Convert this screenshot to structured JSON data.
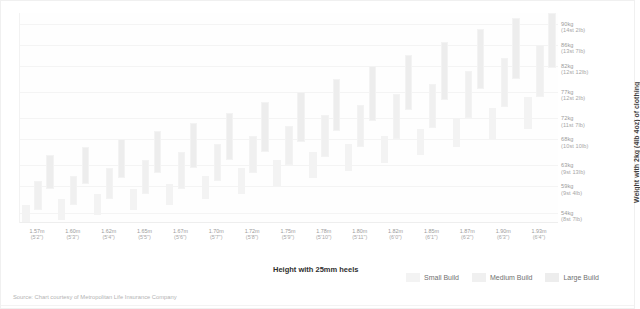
{
  "chart_data": {
    "type": "bar",
    "title": "",
    "subtitle": "",
    "xlabel": "Height with 25mm heels",
    "ylabel": "Weight with 2kg (4lb 4oz) of clothing",
    "ylim": [
      52,
      92
    ],
    "grid": true,
    "legend_position": "bottom-right",
    "source": "Source: Chart courtesy of Metropolitan Life Insurance Company",
    "y_ticks": [
      {
        "kg": 90,
        "label": "90kg",
        "sub": "(14st 2lb)"
      },
      {
        "kg": 86,
        "label": "86kg",
        "sub": "(13st 7lb)"
      },
      {
        "kg": 82,
        "label": "82kg",
        "sub": "(12st 12lb)"
      },
      {
        "kg": 77,
        "label": "77kg",
        "sub": "(12st 2lb)"
      },
      {
        "kg": 72,
        "label": "72kg",
        "sub": "(11st 7lb)"
      },
      {
        "kg": 68,
        "label": "68kg",
        "sub": "(10st 10lb)"
      },
      {
        "kg": 63,
        "label": "63kg",
        "sub": "(9st 13lb)"
      },
      {
        "kg": 59,
        "label": "59kg",
        "sub": "(9st 4lb)"
      },
      {
        "kg": 54,
        "label": "54kg",
        "sub": "(8st 7lb)"
      }
    ],
    "categories": [
      {
        "label": "1.57m",
        "sub": "(5'2\")"
      },
      {
        "label": "1.60m",
        "sub": "(5'3\")"
      },
      {
        "label": "1.62m",
        "sub": "(5'4\")"
      },
      {
        "label": "1.65m",
        "sub": "(5'5\")"
      },
      {
        "label": "1.67m",
        "sub": "(5'6\")"
      },
      {
        "label": "1.70m",
        "sub": "(5'7\")"
      },
      {
        "label": "1.72m",
        "sub": "(5'8\")"
      },
      {
        "label": "1.75m",
        "sub": "(5'9\")"
      },
      {
        "label": "1.78m",
        "sub": "(5'10\")"
      },
      {
        "label": "1.80m",
        "sub": "(5'11\")"
      },
      {
        "label": "1.82m",
        "sub": "(6'0\")"
      },
      {
        "label": "1.85m",
        "sub": "(6'1\")"
      },
      {
        "label": "1.87m",
        "sub": "(6'2\")"
      },
      {
        "label": "1.90m",
        "sub": "(6'3\")"
      },
      {
        "label": "1.93m",
        "sub": "(6'4\")"
      }
    ],
    "series": [
      {
        "name": "Small Build",
        "color": "#f3f3f3",
        "ranges": [
          [
            52.0,
            55.5
          ],
          [
            52.5,
            56.5
          ],
          [
            53.5,
            57.5
          ],
          [
            54.5,
            58.5
          ],
          [
            55.5,
            59.5
          ],
          [
            56.5,
            61.0
          ],
          [
            57.5,
            62.5
          ],
          [
            59.0,
            64.0
          ],
          [
            60.5,
            65.5
          ],
          [
            62.0,
            67.0
          ],
          [
            63.5,
            68.5
          ],
          [
            65.0,
            70.0
          ],
          [
            66.5,
            72.0
          ],
          [
            68.0,
            74.0
          ],
          [
            70.0,
            76.0
          ]
        ]
      },
      {
        "name": "Medium Build",
        "color": "#f0f0f0",
        "ranges": [
          [
            54.5,
            60.0
          ],
          [
            55.5,
            61.0
          ],
          [
            56.5,
            62.5
          ],
          [
            57.5,
            64.0
          ],
          [
            58.5,
            65.5
          ],
          [
            60.0,
            67.0
          ],
          [
            61.5,
            68.5
          ],
          [
            63.0,
            70.5
          ],
          [
            64.5,
            72.5
          ],
          [
            66.5,
            74.5
          ],
          [
            68.0,
            76.5
          ],
          [
            70.0,
            78.5
          ],
          [
            72.0,
            81.0
          ],
          [
            74.0,
            83.5
          ],
          [
            76.0,
            86.0
          ]
        ]
      },
      {
        "name": "Large Build",
        "color": "#ededed",
        "ranges": [
          [
            58.5,
            65.0
          ],
          [
            59.5,
            66.5
          ],
          [
            60.5,
            68.0
          ],
          [
            61.5,
            69.5
          ],
          [
            62.5,
            71.0
          ],
          [
            64.0,
            73.0
          ],
          [
            65.5,
            75.0
          ],
          [
            67.5,
            77.0
          ],
          [
            69.5,
            79.5
          ],
          [
            71.5,
            82.0
          ],
          [
            73.5,
            84.0
          ],
          [
            75.5,
            86.5
          ],
          [
            77.5,
            89.0
          ],
          [
            79.5,
            91.0
          ],
          [
            81.5,
            92.0
          ]
        ]
      }
    ]
  },
  "legend": {
    "items": [
      {
        "label": "Small Build"
      },
      {
        "label": "Medium Build"
      },
      {
        "label": "Large Build"
      }
    ]
  },
  "axis_titles": {
    "x": "Height with 25mm heels",
    "y": "Weight with 2kg (4lb 4oz) of clothing"
  },
  "footer": {
    "source": "Source: Chart courtesy of Metropolitan Life Insurance Company"
  }
}
